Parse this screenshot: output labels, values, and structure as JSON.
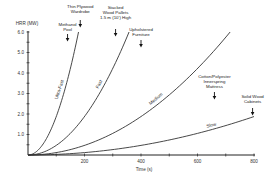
{
  "chart_data": {
    "type": "line",
    "title": "",
    "xlabel": "Time (s)",
    "ylabel": "HRR (MW)",
    "xlim": [
      0,
      800
    ],
    "ylim": [
      0,
      6.0
    ],
    "x_ticks": [
      0,
      100,
      200,
      300,
      400,
      500,
      600,
      700,
      800
    ],
    "x_tick_labels": [
      {
        "value": 200,
        "label": "200"
      },
      {
        "value": 400,
        "label": "400"
      },
      {
        "value": 600,
        "label": "600"
      },
      {
        "value": 800,
        "label": "800"
      }
    ],
    "y_ticks": [
      0,
      0.5,
      1.0,
      1.5,
      2.0,
      2.5,
      3.0,
      3.5,
      4.0,
      4.5,
      5.0,
      5.5,
      6.0
    ],
    "y_tick_labels": [
      {
        "value": 1.0,
        "label": "1.0"
      },
      {
        "value": 2.0,
        "label": "2.0"
      },
      {
        "value": 3.0,
        "label": "3.0"
      },
      {
        "value": 4.0,
        "label": "4.0"
      },
      {
        "value": 5.0,
        "label": "5.0"
      },
      {
        "value": 6.0,
        "label": "6.0"
      }
    ],
    "grid": false,
    "legend": "none (curves labeled inline)",
    "series": [
      {
        "name": "Ultra-Fast",
        "alpha_MW_per_s2": 0.0001876,
        "x": [
          0,
          50,
          100,
          150,
          179
        ],
        "values": [
          0,
          0.47,
          1.88,
          4.22,
          6.0
        ]
      },
      {
        "name": "Fast",
        "alpha_MW_per_s2": 4.69e-05,
        "x": [
          0,
          100,
          200,
          300,
          358
        ],
        "values": [
          0,
          0.47,
          1.88,
          4.22,
          6.0
        ]
      },
      {
        "name": "Medium",
        "alpha_MW_per_s2": 1.172e-05,
        "x": [
          0,
          200,
          400,
          600,
          716
        ],
        "values": [
          0,
          0.47,
          1.88,
          4.22,
          6.0
        ]
      },
      {
        "name": "Slow",
        "alpha_MW_per_s2": 2.93e-06,
        "x": [
          0,
          200,
          400,
          600,
          800
        ],
        "values": [
          0,
          0.12,
          0.47,
          1.05,
          1.88
        ]
      }
    ],
    "annotations": [
      {
        "text": [
          "Methanol",
          "Pool"
        ],
        "arrow_x_s": 140
      },
      {
        "text": [
          "Thin Plywood",
          "Wardrobe"
        ],
        "arrow_x_s": 185
      },
      {
        "text": [
          "Stacked",
          "Wood Pallets",
          "1.5 m (10') High"
        ],
        "arrow_x_s": 310
      },
      {
        "text": [
          "Upholstered",
          "Furniture"
        ],
        "arrow_x_s": 400
      },
      {
        "text": [
          "Cotton/Polyester",
          "Innerspring",
          "Mattress"
        ],
        "arrow_x_s": 660
      },
      {
        "text": [
          "Solid Wood",
          "Cabinets"
        ],
        "arrow_x_s": 795
      }
    ]
  }
}
